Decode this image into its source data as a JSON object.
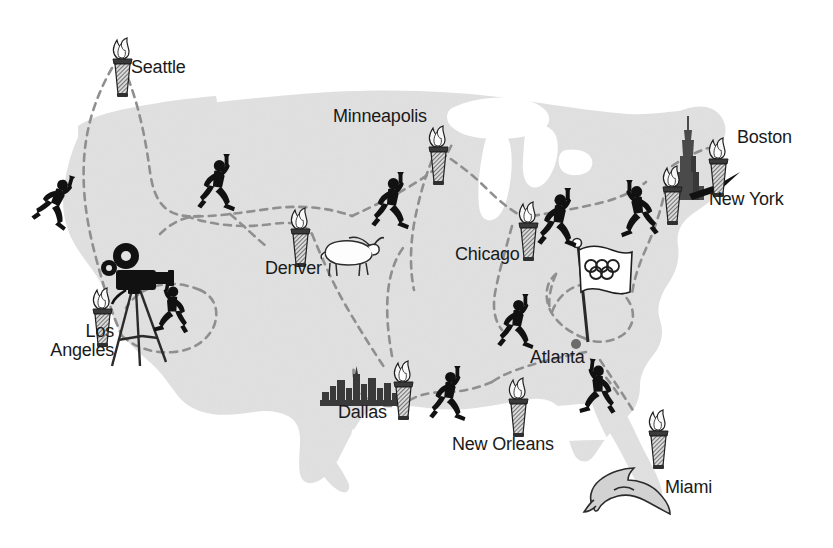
{
  "map": {
    "title": "Olympic Torch Relay Route Map of the United States",
    "land_color": "#e2e2e2",
    "water_color": "#ffffff",
    "route_color": "#8f8f8f",
    "label_color": "#1a1a1a",
    "icon_dark": "#111111",
    "background": "#ffffff",
    "width": 833,
    "height": 548
  },
  "cities": [
    {
      "name": "Seattle",
      "label": "Seattle",
      "x": 131,
      "y": 58,
      "align": "left",
      "lines": [
        "Seattle"
      ]
    },
    {
      "name": "Minneapolis",
      "label": "Minneapolis",
      "x": 333,
      "y": 107,
      "align": "left",
      "lines": [
        "Minneapolis"
      ]
    },
    {
      "name": "Boston",
      "label": "Boston",
      "x": 737,
      "y": 128,
      "align": "left",
      "lines": [
        "Boston"
      ]
    },
    {
      "name": "New York",
      "label": "New York",
      "x": 709,
      "y": 190,
      "align": "left",
      "lines": [
        "New York"
      ]
    },
    {
      "name": "Chicago",
      "label": "Chicago",
      "x": 455,
      "y": 245,
      "align": "left",
      "lines": [
        "Chicago"
      ]
    },
    {
      "name": "Denver",
      "label": "Denver",
      "x": 265,
      "y": 259,
      "align": "left",
      "lines": [
        "Denver"
      ]
    },
    {
      "name": "Los Angeles",
      "label": "Los Angeles",
      "x": 114,
      "y": 322,
      "align": "right",
      "lines": [
        "Los",
        "Angeles"
      ]
    },
    {
      "name": "Atlanta",
      "label": "Atlanta",
      "x": 530,
      "y": 348,
      "align": "left",
      "lines": [
        "Atlanta"
      ]
    },
    {
      "name": "Dallas",
      "label": "Dallas",
      "x": 338,
      "y": 403,
      "align": "left",
      "lines": [
        "Dallas"
      ]
    },
    {
      "name": "New Orleans",
      "label": "New Orleans",
      "x": 452,
      "y": 435,
      "align": "left",
      "lines": [
        "New Orleans"
      ]
    },
    {
      "name": "Miami",
      "label": "Miami",
      "x": 665,
      "y": 478,
      "align": "left",
      "lines": [
        "Miami"
      ]
    }
  ],
  "torches": [
    {
      "name": "torch-seattle",
      "x": 112,
      "y": 40
    },
    {
      "name": "torch-minneapolis",
      "x": 428,
      "y": 128
    },
    {
      "name": "torch-boston",
      "x": 708,
      "y": 140
    },
    {
      "name": "torch-new-york",
      "x": 662,
      "y": 168
    },
    {
      "name": "torch-denver",
      "x": 290,
      "y": 210
    },
    {
      "name": "torch-chicago",
      "x": 518,
      "y": 204
    },
    {
      "name": "torch-los-angeles",
      "x": 92,
      "y": 290
    },
    {
      "name": "torch-dallas",
      "x": 393,
      "y": 363
    },
    {
      "name": "torch-new-orleans",
      "x": 508,
      "y": 380
    },
    {
      "name": "torch-miami",
      "x": 648,
      "y": 412
    }
  ],
  "runners": [
    {
      "name": "runner-pacific-northwest",
      "x": 48,
      "y": 172,
      "flip": false,
      "rot": 18
    },
    {
      "name": "runner-idaho",
      "x": 201,
      "y": 158,
      "flip": false,
      "rot": 0
    },
    {
      "name": "runner-dakota",
      "x": 375,
      "y": 176,
      "flip": false,
      "rot": 0
    },
    {
      "name": "runner-great-lakes",
      "x": 541,
      "y": 192,
      "flip": false,
      "rot": 0
    },
    {
      "name": "runner-northeast",
      "x": 633,
      "y": 184,
      "flip": true,
      "rot": 0
    },
    {
      "name": "runner-california",
      "x": 171,
      "y": 288,
      "flip": true,
      "rot": 10
    },
    {
      "name": "runner-tennessee",
      "x": 501,
      "y": 298,
      "flip": false,
      "rot": 0
    },
    {
      "name": "runner-southeast",
      "x": 594,
      "y": 366,
      "flip": true,
      "rot": 8
    },
    {
      "name": "runner-texas",
      "x": 433,
      "y": 370,
      "flip": false,
      "rot": 0
    }
  ],
  "landmarks": [
    {
      "name": "movie-camera-tripod",
      "label": "Movie camera on tripod",
      "city": "Los Angeles",
      "x": 100,
      "y": 236
    },
    {
      "name": "longhorn-steer",
      "label": "Longhorn steer",
      "city": "Denver",
      "x": 322,
      "y": 234
    },
    {
      "name": "dallas-skyline",
      "label": "City skyline",
      "city": "Dallas",
      "x": 324,
      "y": 372
    },
    {
      "name": "empire-state-building",
      "label": "Empire State Building",
      "city": "New York",
      "x": 676,
      "y": 118
    },
    {
      "name": "olympic-flag",
      "label": "Olympic flag",
      "city": "Atlanta",
      "x": 572,
      "y": 240
    },
    {
      "name": "dolphin",
      "label": "Dolphin",
      "city": "Miami",
      "x": 586,
      "y": 466
    }
  ],
  "annotations": [
    {
      "name": "new-york-pointer-arrow",
      "label": "arrow pointing to Empire State Building"
    }
  ],
  "icons": {
    "torch": "olympic-torch-icon",
    "runner": "torch-runner-icon",
    "flag": "olympic-flag-icon",
    "camera": "movie-camera-icon",
    "steer": "longhorn-steer-icon",
    "skyline": "city-skyline-icon",
    "skyscraper": "empire-state-building-icon",
    "dolphin": "dolphin-icon",
    "arrow": "pointer-arrow-icon"
  }
}
